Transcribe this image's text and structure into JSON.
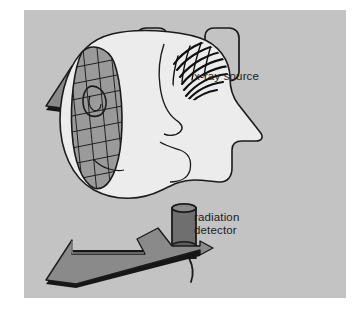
{
  "figure": {
    "title_visible": false,
    "domain": "diagram",
    "background_color": "#ffffff",
    "panel_color": "#c3c3c3"
  },
  "colors": {
    "panel_background": "#c3c3c3",
    "page_background": "#ffffff",
    "beam_arrow_fill": "#8a8a8a",
    "beam_arrow_shadow": "#161616",
    "outline": "#1b1b1b",
    "head_fill": "#ececec",
    "grid_band_fill": "#9a9a9a",
    "detector_fill": "#6f6f6f",
    "hair_stroke": "#101010",
    "label_text": "#1b1b1b"
  },
  "labels": [
    {
      "id": "xray-source",
      "text": "x-ray source",
      "x": 170,
      "y": 60
    },
    {
      "id": "radiation-detector",
      "line1": "radiation",
      "line2": "detector",
      "x": 170,
      "y": 201
    }
  ],
  "components": {
    "xray_source": {
      "name": "x-ray tube housing",
      "label": "x-ray source",
      "position": "top",
      "beam_direction": "down-left"
    },
    "patient_head": {
      "name": "head in profile",
      "orientation": "facing right",
      "features": [
        "hair",
        "ear",
        "nose",
        "chin",
        "neck",
        "grid band"
      ],
      "grid_band": {
        "name": "anti-scatter grid",
        "pattern": "cross-hatch",
        "orientation": "vertical band across face"
      }
    },
    "radiation_detector": {
      "name": "radiation detector",
      "label_line1": "radiation",
      "label_line2": "detector",
      "shape": "cylinder on stand",
      "position": "bottom",
      "beam_direction": "down-left"
    }
  },
  "geometry": {
    "panel": {
      "x": 24,
      "y": 10,
      "w": 322,
      "h": 288
    }
  }
}
